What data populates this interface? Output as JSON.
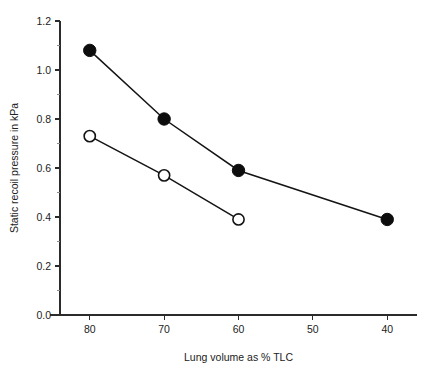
{
  "chart_data": {
    "type": "line",
    "title": "",
    "subtitle": "",
    "xlabel": "Lung volume as % TLC",
    "ylabel": "Static recoil pressure in kPa",
    "xlim": [
      84,
      36
    ],
    "ylim": [
      0.0,
      1.2
    ],
    "x_inverted": true,
    "grid": false,
    "legend": "none",
    "x_ticks": [
      "80",
      "70",
      "60",
      "50",
      "40"
    ],
    "x_tick_values": [
      80,
      70,
      60,
      50,
      40
    ],
    "y_ticks": [
      "0.0",
      "0.2",
      "0.4",
      "0.6",
      "0.8",
      "1.0",
      "1.2"
    ],
    "y_tick_values": [
      0.0,
      0.2,
      0.4,
      0.6,
      0.8,
      1.0,
      1.2
    ],
    "y_minor_tick_values": [
      0.1,
      0.3,
      0.5,
      0.7,
      0.9,
      1.1
    ],
    "annotations": [],
    "series": [
      {
        "name": "filled-circles",
        "marker": "filled-circle",
        "color": "#0d0d0d",
        "x": [
          80,
          70,
          60,
          40
        ],
        "values": [
          1.08,
          0.8,
          0.59,
          0.39
        ]
      },
      {
        "name": "open-circles",
        "marker": "open-circle",
        "color": "#141414",
        "x": [
          80,
          70,
          60
        ],
        "values": [
          0.73,
          0.57,
          0.39
        ]
      }
    ]
  },
  "axes": {
    "x_axis_name": "x-axis",
    "y_axis_name": "y-axis"
  }
}
